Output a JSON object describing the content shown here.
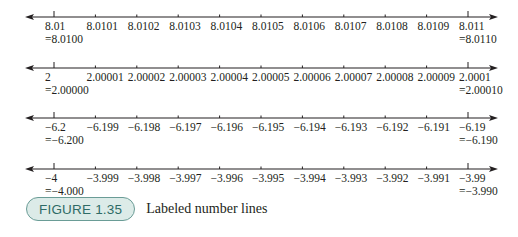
{
  "chart_data": {
    "type": "number-lines",
    "title": "Labeled number lines",
    "figure_label": "FIGURE 1.35",
    "lines": [
      {
        "ticks": [
          "8.01",
          "8.0101",
          "8.0102",
          "8.0103",
          "8.0104",
          "8.0105",
          "8.0106",
          "8.0107",
          "8.0108",
          "8.0109",
          "8.011"
        ],
        "left_note": "=8.0100",
        "right_note": "=8.0110",
        "range": [
          8.01,
          8.011
        ],
        "step": 0.0001
      },
      {
        "ticks": [
          "2",
          "2.00001",
          "2.00002",
          "2.00003",
          "2.00004",
          "2.00005",
          "2.00006",
          "2.00007",
          "2.00008",
          "2.00009",
          "2.0001"
        ],
        "left_note": "=2.00000",
        "right_note": "=2.00010",
        "range": [
          2.0,
          2.0001
        ],
        "step": 1e-05
      },
      {
        "ticks": [
          "−6.2",
          "−6.199",
          "−6.198",
          "−6.197",
          "−6.196",
          "−6.195",
          "−6.194",
          "−6.193",
          "−6.192",
          "−6.191",
          "−6.19"
        ],
        "left_note": "=−6.200",
        "right_note": "=−6.190",
        "range": [
          -6.2,
          -6.19
        ],
        "step": 0.001
      },
      {
        "ticks": [
          "−4",
          "−3.999",
          "−3.998",
          "−3.997",
          "−3.996",
          "−3.995",
          "−3.994",
          "−3.993",
          "−3.992",
          "−3.991",
          "−3.99"
        ],
        "left_note": "=−4.000",
        "right_note": "=−3.990",
        "range": [
          -4.0,
          -3.99
        ],
        "step": 0.001
      }
    ]
  },
  "caption": {
    "label": "FIGURE 1.35",
    "text": "Labeled number lines",
    "badge_fill": "#dcebe8",
    "badge_border": "#6a9c96",
    "badge_text_color": "#2e6b66"
  }
}
